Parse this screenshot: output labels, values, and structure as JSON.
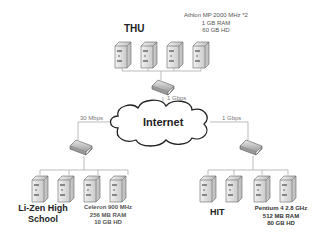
{
  "cloud": {
    "label": "Internet"
  },
  "sites": [
    {
      "name": "THU",
      "specs": [
        "Athlon MP 2000 MHz *2",
        "1 GB RAM",
        "60 GB HD"
      ],
      "link_speed": "1 Gbps"
    },
    {
      "name_line1": "Li-Zen High",
      "name_line2": "School",
      "specs": [
        "Celeron 900 MHz",
        "256 MB RAM",
        "10 GB HD"
      ],
      "link_speed": "30 Mbps"
    },
    {
      "name": "HIT",
      "specs": [
        "Pentium 4 2.8 GHz",
        "512 MB RAM",
        "80 GB HD"
      ],
      "link_speed": "1 Gbps"
    }
  ],
  "colors": {
    "line": "#aaaaaa",
    "cloud_stroke": "#222222"
  }
}
